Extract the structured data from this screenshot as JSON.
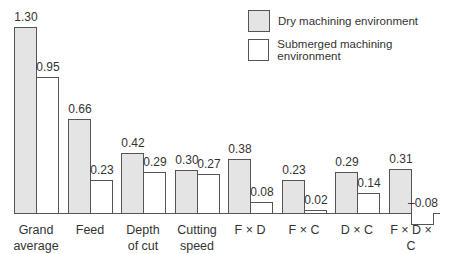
{
  "chart_data": {
    "type": "bar",
    "title": "",
    "xlabel": "",
    "ylabel": "",
    "categories": [
      "Grand\naverage",
      "Feed",
      "Depth\nof cut",
      "Cutting\nspeed",
      "F × D",
      "F × C",
      "D × C",
      "F × D × C"
    ],
    "series": [
      {
        "name": "Dry machining environment",
        "values": [
          1.3,
          0.66,
          0.42,
          0.3,
          0.38,
          0.23,
          0.29,
          0.31
        ],
        "color": "#e4e4e4"
      },
      {
        "name": "Submerged machining environment",
        "values": [
          0.95,
          0.23,
          0.29,
          0.27,
          0.08,
          0.02,
          0.14,
          -0.08
        ],
        "color": "#ffffff"
      }
    ],
    "value_labels": {
      "dry": [
        "1.30",
        "0.66",
        "0.42",
        "0.30",
        "0.38",
        "0.23",
        "0.29",
        "0.31"
      ],
      "submerged": [
        "0.95",
        "0.23",
        "0.29",
        "0.27",
        "0.08",
        "0.02",
        "0.14",
        "–0.08"
      ]
    },
    "legend_position": "top-right",
    "grid": false,
    "ylim": [
      -0.1,
      1.4
    ]
  },
  "legend": {
    "dry_label": "Dry machining environment",
    "submerged_label": "Submerged machining environment"
  }
}
